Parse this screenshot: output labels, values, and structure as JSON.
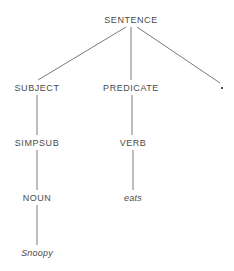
{
  "figure": {
    "type": "parse-tree",
    "background_color": "#ffffff",
    "text_color": "#4a4a4a",
    "edge_color": "#6b6b6b",
    "width": 234,
    "height": 271
  },
  "nodes": [
    {
      "id": "sentence",
      "label": "SENTENCE",
      "kind": "nonterminal",
      "x": 131,
      "y": 20,
      "level": 0
    },
    {
      "id": "subject",
      "label": "SUBJECT",
      "kind": "nonterminal",
      "x": 37,
      "y": 88,
      "level": 1
    },
    {
      "id": "predicate",
      "label": "PREDICATE",
      "kind": "nonterminal",
      "x": 131,
      "y": 88,
      "level": 1
    },
    {
      "id": "period",
      "label": ".",
      "kind": "punctuation",
      "x": 222,
      "y": 88,
      "level": 1
    },
    {
      "id": "simpsub",
      "label": "SIMPSUB",
      "kind": "nonterminal",
      "x": 37,
      "y": 143,
      "level": 2
    },
    {
      "id": "verb",
      "label": "VERB",
      "kind": "nonterminal",
      "x": 133,
      "y": 143,
      "level": 2
    },
    {
      "id": "noun",
      "label": "NOUN",
      "kind": "nonterminal",
      "x": 37,
      "y": 198,
      "level": 3
    },
    {
      "id": "eats",
      "label": "eats",
      "kind": "terminal",
      "x": 133,
      "y": 198,
      "level": 3
    },
    {
      "id": "snoopy",
      "label": "Snoopy",
      "kind": "terminal",
      "x": 37,
      "y": 253,
      "level": 4
    }
  ],
  "edges": [
    {
      "from": "sentence",
      "to": "subject",
      "x1": 126,
      "y1": 27,
      "x2": 38,
      "y2": 80
    },
    {
      "from": "sentence",
      "to": "predicate",
      "x1": 131,
      "y1": 27,
      "x2": 131,
      "y2": 80
    },
    {
      "from": "sentence",
      "to": "period",
      "x1": 137,
      "y1": 27,
      "x2": 220,
      "y2": 83
    },
    {
      "from": "subject",
      "to": "simpsub",
      "x1": 37,
      "y1": 95,
      "x2": 37,
      "y2": 135
    },
    {
      "from": "predicate",
      "to": "verb",
      "x1": 132,
      "y1": 95,
      "x2": 132,
      "y2": 135
    },
    {
      "from": "simpsub",
      "to": "noun",
      "x1": 37,
      "y1": 150,
      "x2": 37,
      "y2": 190
    },
    {
      "from": "verb",
      "to": "eats",
      "x1": 133,
      "y1": 150,
      "x2": 133,
      "y2": 190
    },
    {
      "from": "noun",
      "to": "snoopy",
      "x1": 37,
      "y1": 205,
      "x2": 37,
      "y2": 245
    }
  ]
}
